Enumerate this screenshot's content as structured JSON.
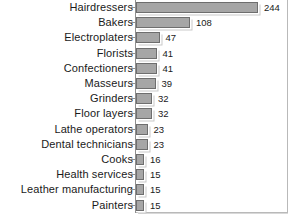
{
  "chart_data": {
    "type": "bar",
    "orientation": "horizontal",
    "title": "",
    "subtitle": "",
    "xlabel": "",
    "ylabel": "",
    "grid": false,
    "legend": null,
    "xlim": [
      0,
      244
    ],
    "value_labels_shown": true,
    "categories": [
      "Hairdressers",
      "Bakers",
      "Electroplaters",
      "Florists",
      "Confectioners",
      "Masseurs",
      "Grinders",
      "Floor layers",
      "Lathe operators",
      "Dental technicians",
      "Cooks",
      "Health services",
      "Leather manufacturing",
      "Painters"
    ],
    "values": [
      244,
      108,
      47,
      41,
      41,
      39,
      32,
      32,
      23,
      23,
      16,
      15,
      15,
      15
    ],
    "bars": [
      {
        "label": "Hairdressers",
        "value": 244,
        "value_text": "244"
      },
      {
        "label": "Bakers",
        "value": 108,
        "value_text": "108"
      },
      {
        "label": "Electroplaters",
        "value": 47,
        "value_text": "47"
      },
      {
        "label": "Florists",
        "value": 41,
        "value_text": "41"
      },
      {
        "label": "Confectioners",
        "value": 41,
        "value_text": "41"
      },
      {
        "label": "Masseurs",
        "value": 39,
        "value_text": "39"
      },
      {
        "label": "Grinders",
        "value": 32,
        "value_text": "32"
      },
      {
        "label": "Floor layers",
        "value": 32,
        "value_text": "32"
      },
      {
        "label": "Lathe operators",
        "value": 23,
        "value_text": "23"
      },
      {
        "label": "Dental technicians",
        "value": 23,
        "value_text": "23"
      },
      {
        "label": "Cooks",
        "value": 16,
        "value_text": "16"
      },
      {
        "label": "Health services",
        "value": 15,
        "value_text": "15"
      },
      {
        "label": "Leather manufacturing",
        "value": 15,
        "value_text": "15"
      },
      {
        "label": "Painters",
        "value": 15,
        "value_text": "15"
      }
    ],
    "colors": {
      "bar_fill": "#a6a6a6",
      "bar_stroke": "#6e6e6e",
      "bar_shadow": "#c9c9c9",
      "axis": "#8f8f8f",
      "frame": "#b9b9b9",
      "text": "#1a1a1a",
      "background": "#ffffff"
    }
  }
}
